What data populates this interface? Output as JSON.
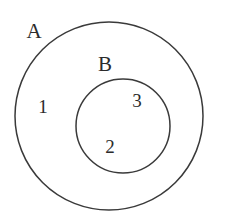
{
  "figure": {
    "type": "venn-diagram",
    "background_color": "#ffffff",
    "stroke_color": "#3a3a3a",
    "text_color": "#2b2b2b",
    "width": 225,
    "height": 224
  },
  "sets": [
    {
      "id": "A",
      "label": "A",
      "label_x": 34,
      "label_y": 33,
      "cx": 109,
      "cy": 116,
      "r": 94,
      "stroke_width": 1.5
    },
    {
      "id": "B",
      "label": "B",
      "label_x": 105,
      "label_y": 66,
      "cx": 123,
      "cy": 126,
      "r": 47,
      "stroke_width": 1.5
    }
  ],
  "regions": [
    {
      "id": "region-1",
      "label": "1",
      "x": 43,
      "y": 109,
      "description": "inside A only"
    },
    {
      "id": "region-2",
      "label": "2",
      "x": 110,
      "y": 149,
      "description": "inside B lower"
    },
    {
      "id": "region-3",
      "label": "3",
      "x": 137,
      "y": 103,
      "description": "inside B upper"
    }
  ]
}
